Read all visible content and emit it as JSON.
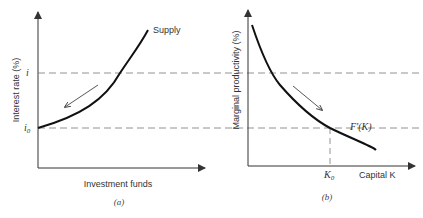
{
  "panels": [
    {
      "id": "a",
      "caption": "(a)",
      "y_axis_label": "Interest rate (%)",
      "x_axis_label": "Investment funds",
      "curve_label": "Supply",
      "tick_labels": {
        "upper": "i",
        "lower": "i",
        "lower_sub": "0"
      },
      "arrow_direction": "down-left along curve"
    },
    {
      "id": "b",
      "caption": "(b)",
      "y_axis_label": "Marginal productivity (%)",
      "x_axis_label": "Capital K",
      "curve_label": "F'(K)",
      "tick_labels": {
        "k": "K",
        "k_sub": "0"
      },
      "arrow_direction": "down-right along curve"
    }
  ]
}
